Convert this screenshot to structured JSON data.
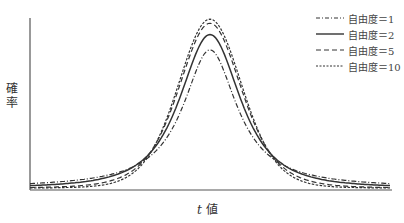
{
  "chart_data": {
    "type": "line",
    "title": "",
    "xlabel": "t 値",
    "ylabel": "確率",
    "xlim": [
      -5.5,
      5.5
    ],
    "ylim": [
      0,
      0.4
    ],
    "grid": false,
    "legend_position": "upper right",
    "series": [
      {
        "name": "自由度＝1",
        "df": 1,
        "style": "dashdot",
        "peak": 0.318
      },
      {
        "name": "自由度＝2",
        "df": 2,
        "style": "solid",
        "peak": 0.354
      },
      {
        "name": "自由度＝5",
        "df": 5,
        "style": "dashed",
        "peak": 0.38
      },
      {
        "name": "自由度＝10",
        "df": 10,
        "style": "dotted-dash",
        "peak": 0.389
      }
    ]
  },
  "axes": {
    "ylabel": "確率",
    "xlabel_italic": "t",
    "xlabel_rest": " 値"
  }
}
